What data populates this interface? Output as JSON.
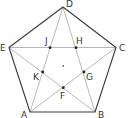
{
  "diagram": {
    "type": "regular-pentagon-with-pentagram",
    "colors": {
      "outer_edge": "#3a3a3a",
      "inner_line": "#b0b0b0",
      "point": "#222222",
      "label": "#333333"
    },
    "vertices": {
      "A": {
        "label": "A",
        "x": 30,
        "y": 112
      },
      "B": {
        "label": "B",
        "x": 95,
        "y": 112
      },
      "C": {
        "label": "C",
        "x": 116,
        "y": 47.5
      },
      "D": {
        "label": "D",
        "x": 63,
        "y": 7
      },
      "E": {
        "label": "E",
        "x": 9,
        "y": 47.5
      }
    },
    "inner_points": {
      "F": {
        "label": "F",
        "x": 63.3,
        "y": 87.7
      },
      "G": {
        "label": "G",
        "x": 84,
        "y": 72
      },
      "H": {
        "label": "H",
        "x": 76,
        "y": 47.7
      },
      "J": {
        "label": "J",
        "x": 50,
        "y": 47.7
      },
      "K": {
        "label": "K",
        "x": 42.7,
        "y": 72
      }
    },
    "center": {
      "x": 63.3,
      "y": 66
    },
    "outer_edges": [
      "AB",
      "BC",
      "CD",
      "DE",
      "EA"
    ],
    "diagonals": [
      "AC",
      "AD",
      "BD",
      "BE",
      "CE"
    ]
  }
}
